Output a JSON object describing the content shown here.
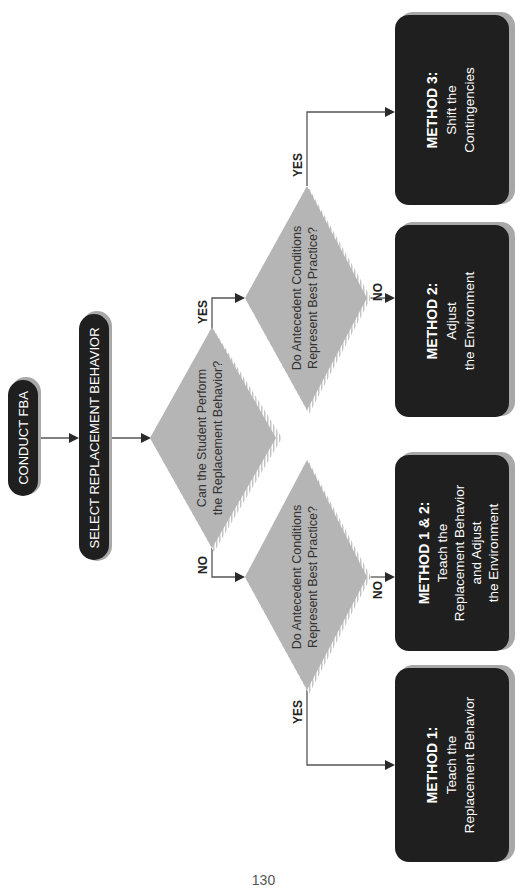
{
  "diagram": {
    "orientation": "rotated-90-ccw",
    "colors": {
      "terminal_fill": "#1f1f1f",
      "terminal_shadow": "#a8a8a8",
      "decision_fill": "#b5b5b5",
      "decision_hatch": "#d0d0d0",
      "connector": "#555555",
      "text_light": "#ffffff",
      "text_dark": "#333333"
    },
    "start": {
      "label": "CONDUCT FBA"
    },
    "select": {
      "label": "SELECT REPLACEMENT BEHAVIOR"
    },
    "decision_main": {
      "line1": "Can the Student Perform",
      "line2": "the Replacement Behavior?",
      "yes_label": "YES",
      "no_label": "NO"
    },
    "decision_yes": {
      "line1": "Do Antecedent Conditions",
      "line2": "Represent Best Practice?",
      "yes_label": "YES",
      "no_label": "NO"
    },
    "decision_no": {
      "line1": "Do Antecedent Conditions",
      "line2": "Represent Best Practice?",
      "yes_label": "YES",
      "no_label": "NO"
    },
    "outcomes": [
      {
        "title": "METHOD 3:",
        "lines": [
          "Shift the",
          "Contingencies"
        ]
      },
      {
        "title": "METHOD 2:",
        "lines": [
          "Adjust",
          "the Environment"
        ]
      },
      {
        "title": "METHOD 1 & 2:",
        "lines": [
          "Teach the",
          "Replacement Behavior",
          "and Adjust",
          "the Environment"
        ]
      },
      {
        "title": "METHOD 1:",
        "lines": [
          "Teach the",
          "Replacement Behavior"
        ]
      }
    ]
  },
  "page": {
    "number": "130"
  }
}
